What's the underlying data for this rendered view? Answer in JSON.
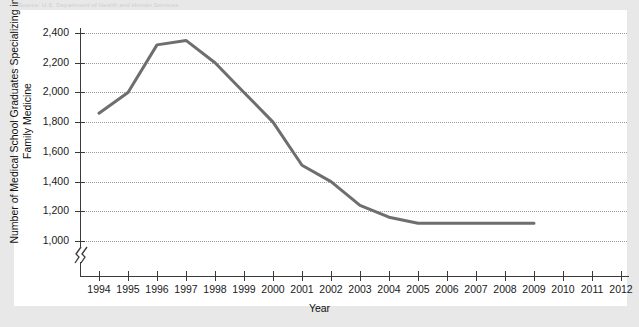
{
  "top_caption": "Source: U.S. Department of Health and Human Services",
  "chart_data": {
    "type": "line",
    "title": "",
    "xlabel": "Year",
    "ylabel": "Number of Medical School Graduates Specializing in Family Medicine",
    "x": [
      1994,
      1995,
      1996,
      1997,
      1998,
      1999,
      2000,
      2001,
      2002,
      2003,
      2004,
      2005,
      2006,
      2007,
      2008,
      2009
    ],
    "values": [
      1860,
      2000,
      2320,
      2350,
      2200,
      2000,
      1800,
      1510,
      1400,
      1240,
      1160,
      1120,
      1120,
      1120,
      1120,
      1120
    ],
    "series": [
      {
        "name": "Family Medicine Graduates",
        "values": [
          1860,
          2000,
          2320,
          2350,
          2200,
          2000,
          1800,
          1510,
          1400,
          1240,
          1160,
          1120,
          1120,
          1120,
          1120,
          1120
        ]
      }
    ],
    "xlim": [
      1994,
      2012
    ],
    "ylim": [
      1000,
      2400
    ],
    "x_ticks": [
      "1994",
      "1995",
      "1996",
      "1997",
      "1998",
      "1999",
      "2000",
      "2001",
      "2002",
      "2003",
      "2004",
      "2005",
      "2006",
      "2007",
      "2008",
      "2009",
      "2010",
      "2011",
      "2012"
    ],
    "y_ticks": [
      "1,000",
      "1,200",
      "1,400",
      "1,600",
      "1,800",
      "2,000",
      "2,200",
      "2,400"
    ],
    "y_tick_values": [
      1000,
      1200,
      1400,
      1600,
      1800,
      2000,
      2200,
      2400
    ],
    "grid": true,
    "grid_style": "dotted-horizontal",
    "legend": "none",
    "axis_break": true,
    "line_color": "#6e6e6e",
    "line_width": 3,
    "axis_color": "#3a3a3a",
    "grid_color": "#9a9a9a",
    "plot_background": "#ffffff",
    "page_background": "#e8e8e8"
  }
}
